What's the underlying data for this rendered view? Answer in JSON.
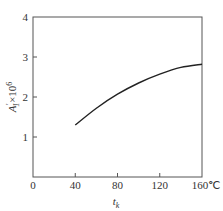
{
  "chart_data": {
    "type": "line",
    "title": "",
    "xlabel": "t_k",
    "ylabel": "A'_1 × 10^6",
    "x_unit": "℃",
    "xlim": [
      0,
      160
    ],
    "ylim": [
      0,
      4
    ],
    "x_ticks": [
      "0",
      "40",
      "80",
      "120",
      "160℃"
    ],
    "y_ticks": [
      "1",
      "2",
      "3",
      "4"
    ],
    "grid": false,
    "legend": null,
    "series": [
      {
        "name": "A'_1 × 10^6",
        "x": [
          40,
          60,
          80,
          100,
          120,
          140,
          160
        ],
        "y": [
          1.3,
          1.72,
          2.07,
          2.35,
          2.57,
          2.74,
          2.82
        ]
      }
    ]
  },
  "labels": {
    "x_axis": "t",
    "x_axis_sub": "k",
    "y_axis_main": "A",
    "y_axis_sup": "′",
    "y_axis_sub": "1",
    "y_axis_mult": "×10",
    "y_axis_exp": "6",
    "x_unit": "℃"
  }
}
